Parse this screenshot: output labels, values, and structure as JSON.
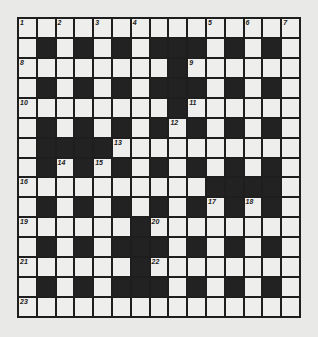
{
  "puzzle": {
    "rows": 15,
    "cols": 15,
    "colors": {
      "white": "#eeeeec",
      "black": "#222222",
      "paper": "#e9e9e7"
    },
    "grid": [
      "...............",
      ".#.#.#.###.#.#.",
      "........#......",
      ".#.#.#.###.#.#.",
      "........#......",
      ".#.#.#.#.#.#.#.",
      ".####..........",
      ".#.#.#.#.#.#.#.",
      "..........####.",
      ".#.#.#.#.#.#.#.",
      "......#........",
      ".#.#.###.#.#.#.",
      "......#........",
      ".#.#.###.#.#.#.",
      "..............."
    ],
    "numbers": [
      {
        "r": 0,
        "c": 0,
        "n": "1"
      },
      {
        "r": 0,
        "c": 2,
        "n": "2"
      },
      {
        "r": 0,
        "c": 4,
        "n": "3"
      },
      {
        "r": 0,
        "c": 6,
        "n": "4"
      },
      {
        "r": 0,
        "c": 10,
        "n": "5"
      },
      {
        "r": 0,
        "c": 12,
        "n": "6"
      },
      {
        "r": 0,
        "c": 14,
        "n": "7"
      },
      {
        "r": 2,
        "c": 0,
        "n": "8"
      },
      {
        "r": 2,
        "c": 9,
        "n": "9"
      },
      {
        "r": 4,
        "c": 0,
        "n": "10"
      },
      {
        "r": 4,
        "c": 9,
        "n": "11"
      },
      {
        "r": 5,
        "c": 8,
        "n": "12"
      },
      {
        "r": 6,
        "c": 5,
        "n": "13"
      },
      {
        "r": 7,
        "c": 2,
        "n": "14"
      },
      {
        "r": 7,
        "c": 4,
        "n": "15"
      },
      {
        "r": 8,
        "c": 0,
        "n": "16"
      },
      {
        "r": 9,
        "c": 10,
        "n": "17"
      },
      {
        "r": 9,
        "c": 12,
        "n": "18"
      },
      {
        "r": 10,
        "c": 0,
        "n": "19"
      },
      {
        "r": 10,
        "c": 7,
        "n": "20"
      },
      {
        "r": 12,
        "c": 0,
        "n": "21"
      },
      {
        "r": 12,
        "c": 7,
        "n": "22"
      },
      {
        "r": 14,
        "c": 0,
        "n": "23"
      }
    ]
  }
}
